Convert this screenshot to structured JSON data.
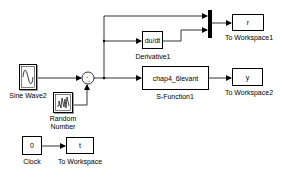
{
  "diagram": {
    "type": "simulink-model",
    "blocks": [
      {
        "id": "sine",
        "name": "Sine Wave2",
        "icon": "sine-wave-icon"
      },
      {
        "id": "random",
        "name_line1": "Random",
        "name_line2": "Number",
        "icon": "random-signal-icon"
      },
      {
        "id": "sum",
        "name": "Sum",
        "signs": "++"
      },
      {
        "id": "derivative",
        "name": "Derivative1",
        "text": "du/dt"
      },
      {
        "id": "mux",
        "name": "Mux"
      },
      {
        "id": "toworkspace1",
        "name": "To Workspace1",
        "text": "r"
      },
      {
        "id": "sfunction",
        "name": "S-Function1",
        "text": "chap4_6levant"
      },
      {
        "id": "toworkspace2",
        "name": "To Workspace2",
        "text": "y"
      },
      {
        "id": "clock",
        "name": "Clock",
        "text": "0"
      },
      {
        "id": "toworkspace",
        "name": "To Workspace",
        "text": "t"
      }
    ],
    "connections": [
      [
        "Sine Wave2",
        "Sum"
      ],
      [
        "Random Number",
        "Sum"
      ],
      [
        "Sum",
        "Mux"
      ],
      [
        "Sum",
        "Derivative1"
      ],
      [
        "Sum",
        "S-Function1"
      ],
      [
        "Derivative1",
        "Mux"
      ],
      [
        "Mux",
        "To Workspace1"
      ],
      [
        "S-Function1",
        "To Workspace2"
      ],
      [
        "Clock",
        "To Workspace"
      ]
    ],
    "colors": {
      "line": "#000000",
      "block_border": "#000000",
      "background": "#ffffff"
    }
  }
}
